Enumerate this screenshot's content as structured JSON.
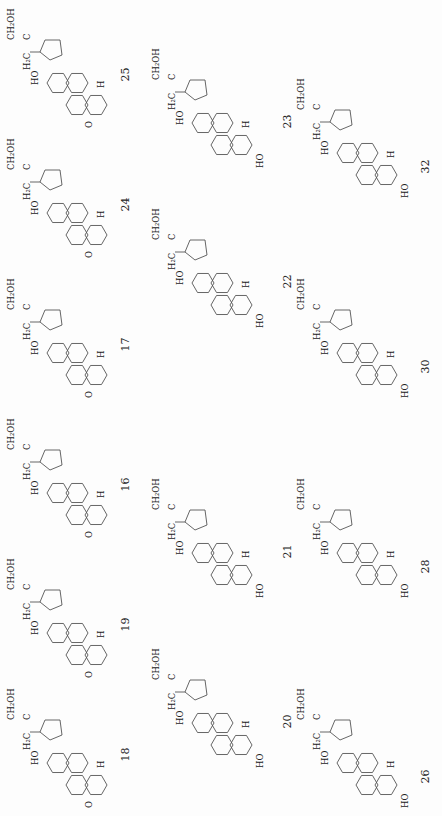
{
  "figure": {
    "orientation": "rotated 90 degrees counter-clockwise",
    "rows": [
      {
        "position": "left column (top row when upright)",
        "compounds": [
          {
            "number": "25",
            "ring_A": "3-oxo",
            "h5": "H",
            "side_chain": "CH2OH / C–OH / H",
            "c18": "HO–H2C"
          },
          {
            "number": "24",
            "ring_A": "3-oxo",
            "h5": "H",
            "side_chain": "CH2OH / HO–C–H",
            "c18": "HO–H2C"
          },
          {
            "number": "17",
            "ring_A": "3-oxo",
            "h5": "H",
            "side_chain": "CH2OH / C=O",
            "c18": "HO–H2C"
          },
          {
            "number": "16",
            "ring_A": "3-oxo",
            "h5": "H (alpha, dashed)",
            "side_chain": "CH2OH / C=O",
            "c18": "HO–H2C"
          },
          {
            "number": "19",
            "ring_A": "3-oxo",
            "h5": "H (alpha, dashed)",
            "side_chain": "CH2OH / H–C–OH",
            "c18": "HO–H2C"
          },
          {
            "number": "18",
            "ring_A": "3-oxo",
            "h5": "H",
            "side_chain": "CH2OH / HO–C–H",
            "c18": "HO–H2C"
          }
        ]
      },
      {
        "position": "middle column",
        "compounds": [
          {
            "number": "23",
            "ring_A": "3-OH",
            "h5": "H",
            "side_chain": "CH2OH / C=O",
            "c18": "HO–H2C"
          },
          {
            "number": "22",
            "ring_A": "3-OH (beta)",
            "h5": "H",
            "side_chain": "CH2OH / C=O",
            "c18": "HO–H2C"
          },
          {
            "number": "21",
            "ring_A": "3-OH",
            "h5": "H (alpha)",
            "side_chain": "CH2OH / C=O",
            "c18": "HO–H2C"
          },
          {
            "number": "20",
            "ring_A": "3-OH (alpha)",
            "h5": "H",
            "side_chain": "CH2OH / C=O",
            "c18": "HO–H2C"
          }
        ]
      },
      {
        "position": "right column",
        "compounds": [
          {
            "number": "32",
            "ring_A": "3-OH",
            "h5": "H",
            "side_chain": "CH2OH / H–C–OH",
            "c18": "HO–H2C"
          },
          {
            "number": "30",
            "ring_A": "3-OH (alpha)",
            "h5": "H",
            "side_chain": "CH2OH / H–C–OH",
            "c18": "HO–H2C"
          },
          {
            "number": "28",
            "ring_A": "3-OH",
            "h5": "H (alpha)",
            "side_chain": "CH2OH / H–C–OH",
            "c18": "HO–H2C"
          },
          {
            "number": "26",
            "ring_A": "3-OH",
            "h5": "H",
            "side_chain": "CH2OH / H–C–OH",
            "c18": "HO–H2C"
          }
        ]
      }
    ]
  },
  "labels": {
    "ch2oh": "CH₂OH",
    "oh": "OH",
    "ho": "HO",
    "h": "H",
    "c": "C",
    "h2c": "H₂",
    "o": "O"
  }
}
